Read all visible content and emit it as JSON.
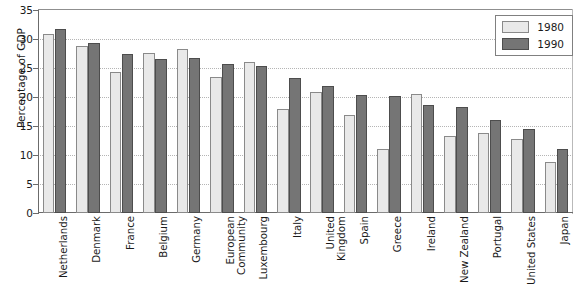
{
  "chart_data": {
    "type": "bar",
    "title": "",
    "xlabel": "",
    "ylabel": "Percentage of GDP",
    "ylim": [
      0,
      35
    ],
    "ytick_values": [
      35,
      30,
      25,
      20,
      15,
      10,
      5,
      0
    ],
    "grid": true,
    "legend_position": "top-right",
    "categories": [
      "Netherlands",
      "Denmark",
      "France",
      "Belgium",
      "Germany",
      "European\nCommunity",
      "Luxembourg",
      "Italy",
      "United\nKingdom",
      "Spain",
      "Greece",
      "Ireland",
      "New Zealand",
      "Portugal",
      "United States",
      "Japan"
    ],
    "series": [
      {
        "name": "1980",
        "color": "#e9e9e9",
        "values": [
          30.9,
          28.8,
          24.3,
          27.6,
          28.3,
          23.5,
          26.0,
          17.9,
          20.9,
          16.9,
          11.1,
          20.6,
          13.3,
          13.8,
          12.8,
          8.8
        ]
      },
      {
        "name": "1990",
        "color": "#757575",
        "values": [
          31.7,
          29.3,
          27.5,
          26.6,
          26.7,
          25.7,
          25.4,
          23.3,
          21.9,
          20.3,
          20.2,
          18.6,
          18.2,
          16.0,
          14.4,
          11.0
        ]
      }
    ]
  },
  "legend": {
    "items": [
      {
        "label": "1980"
      },
      {
        "label": "1990"
      }
    ]
  }
}
